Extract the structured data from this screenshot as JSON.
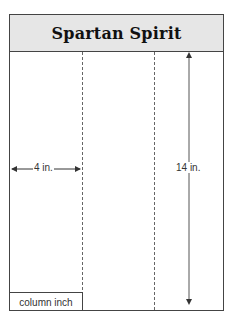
{
  "diagram": {
    "title": "Spartan Spirit",
    "width_label": "4 in.",
    "height_label": "14 in.",
    "unit_label": "column inch",
    "columns": 3,
    "colors": {
      "header_bg": "#e6e6e6",
      "border": "#444444",
      "text": "#333333"
    }
  }
}
